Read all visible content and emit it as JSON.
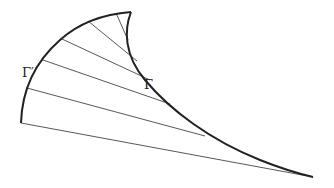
{
  "diagram": {
    "labels": {
      "involute_label": "Γ′",
      "evolute_label": "Γ"
    },
    "colors": {
      "curve": "#222222",
      "ray": "#444444",
      "background": "#ffffff"
    }
  }
}
